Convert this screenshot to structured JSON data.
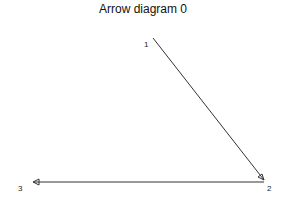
{
  "title": "Arrow diagram 0",
  "nodes": [
    {
      "id": "1",
      "label": "1",
      "x": 146,
      "y": 42
    },
    {
      "id": "2",
      "label": "2",
      "x": 268,
      "y": 186
    },
    {
      "id": "3",
      "label": "3",
      "x": 18,
      "y": 186
    }
  ],
  "edges": [
    {
      "from": "1",
      "to": "2",
      "arrowhead": "open-triangle"
    },
    {
      "from": "2",
      "to": "3",
      "arrowhead": "open-triangle"
    }
  ],
  "colors": {
    "line": "#333333",
    "background": "#ffffff"
  }
}
